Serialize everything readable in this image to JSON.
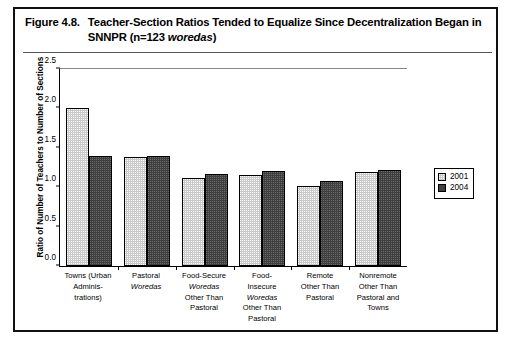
{
  "figure": {
    "number": "Figure 4.8.",
    "caption_part1": "Teacher-Section Ratios Tended to Equalize Since Decentralization Began in SNNPR (n=123 ",
    "caption_italic": "woredas",
    "caption_part2": ")"
  },
  "legend": {
    "position": "right",
    "entries": [
      {
        "label": "2001",
        "color": "#c9c9c9"
      },
      {
        "label": "2004",
        "color": "#3f3f3f"
      }
    ]
  },
  "axis": {
    "y_title": "Ratio of Number of Teachers to Number of Sections",
    "y_ticks": [
      "0.0",
      "0.5",
      "1.0",
      "1.5",
      "2.0",
      "2.5"
    ]
  },
  "categories_display": [
    {
      "lines": [
        {
          "text": "Towns (Urban",
          "italic": false
        },
        {
          "text": "Adminis-",
          "italic": false
        },
        {
          "text": "trations)",
          "italic": false
        }
      ]
    },
    {
      "lines": [
        {
          "text": "Pastoral",
          "italic": false
        },
        {
          "text": "Woredas",
          "italic": true
        }
      ]
    },
    {
      "lines": [
        {
          "text": "Food-Secure",
          "italic": false
        },
        {
          "text": "Woredas",
          "italic": true
        },
        {
          "text": "Other Than",
          "italic": false
        },
        {
          "text": "Pastoral",
          "italic": false
        }
      ]
    },
    {
      "lines": [
        {
          "text": "Food-",
          "italic": false
        },
        {
          "text": "Insecure",
          "italic": false
        },
        {
          "text": "Woredas",
          "italic": true
        },
        {
          "text": "Other Than",
          "italic": false
        },
        {
          "text": "Pastoral",
          "italic": false
        }
      ]
    },
    {
      "lines": [
        {
          "text": "Remote",
          "italic": false
        },
        {
          "text": "Other Than",
          "italic": false
        },
        {
          "text": "Pastoral",
          "italic": false
        }
      ]
    },
    {
      "lines": [
        {
          "text": "Nonremote",
          "italic": false
        },
        {
          "text": "Other Than",
          "italic": false
        },
        {
          "text": "Pastoral and",
          "italic": false
        },
        {
          "text": "Towns",
          "italic": false
        }
      ]
    }
  ],
  "chart_data": {
    "type": "bar",
    "title": "Teacher-Section Ratios Tended to Equalize Since Decentralization Began in SNNPR (n=123 woredas)",
    "xlabel": "",
    "ylabel": "Ratio of Number of Teachers to Number of Sections",
    "ylim": [
      0,
      2.5
    ],
    "ytick_interval": 0.5,
    "grid": false,
    "legend_position": "right",
    "categories": [
      "Towns (Urban Administrations)",
      "Pastoral Woredas",
      "Food-Secure Woredas Other Than Pastoral",
      "Food-Insecure Woredas Other Than Pastoral",
      "Remote Other Than Pastoral",
      "Nonremote Other Than Pastoral and Towns"
    ],
    "series": [
      {
        "name": "2001",
        "color": "#c9c9c9",
        "values": [
          2.0,
          1.38,
          1.12,
          1.16,
          1.01,
          1.19
        ]
      },
      {
        "name": "2004",
        "color": "#3f3f3f",
        "values": [
          1.4,
          1.39,
          1.17,
          1.2,
          1.08,
          1.22
        ]
      }
    ]
  }
}
